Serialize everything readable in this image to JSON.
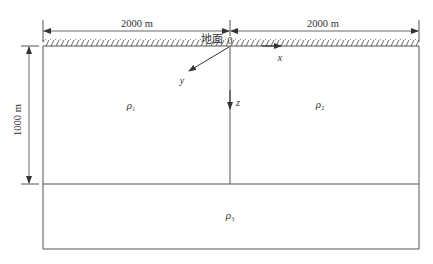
{
  "diagram": {
    "type": "geoelectric-model-cross-section",
    "dimensions": {
      "left_width_label": "2000 m",
      "right_width_label": "2000 m",
      "depth_label": "1000 m"
    },
    "surface_label": "地面",
    "origin_label": "0",
    "axes": {
      "x_label": "x",
      "y_label": "y",
      "z_label": "z"
    },
    "regions": [
      {
        "id": "rho1",
        "symbol": "ρ",
        "subscript": "1",
        "position": "upper-left"
      },
      {
        "id": "rho2",
        "symbol": "ρ",
        "subscript": "2",
        "position": "upper-right"
      },
      {
        "id": "rho3",
        "symbol": "ρ",
        "subscript": "3",
        "position": "bottom-layer"
      }
    ],
    "colors": {
      "line": "#555555",
      "text": "#333333",
      "background": "#ffffff"
    }
  }
}
